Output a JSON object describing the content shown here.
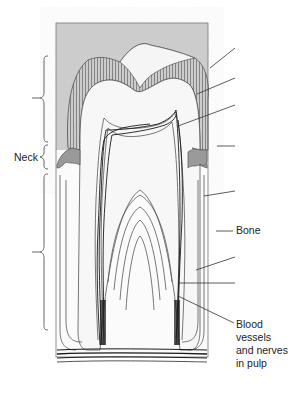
{
  "diagram": {
    "colors": {
      "background": "#ffffff",
      "bone_shade": "#cfcfcf",
      "gum_shade": "#9a9a9a",
      "line": "#555555",
      "dark_line": "#1a1a1a",
      "text": "#222222"
    },
    "labels": {
      "neck": "Neck",
      "bone": "Bone",
      "blood_vessels_line1": "Blood",
      "blood_vessels_line2": "vessels",
      "blood_vessels_line3": "and nerves",
      "blood_vessels_line4": "in pulp"
    },
    "brackets": [
      {
        "name": "crown-bracket",
        "label": ""
      },
      {
        "name": "neck-bracket",
        "label": "Neck"
      },
      {
        "name": "root-bracket",
        "label": ""
      }
    ],
    "unlabeled_leader_lines": 7
  }
}
